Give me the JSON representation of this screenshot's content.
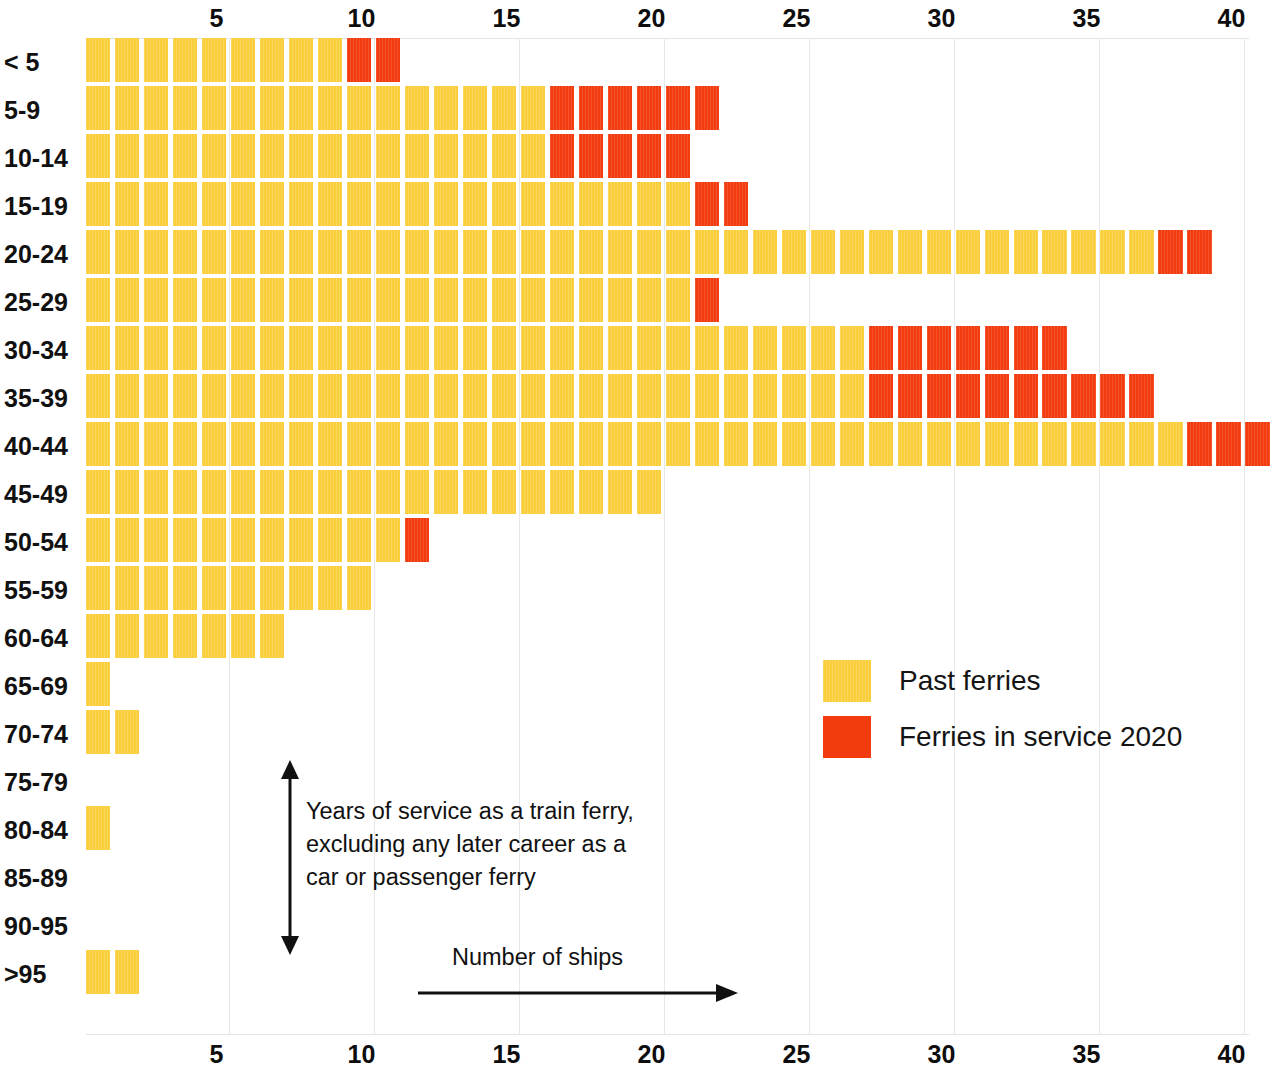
{
  "chart_data": {
    "type": "bar",
    "subtype": "unit-pictogram-horizontal-stacked",
    "title": "",
    "xlabel": "Number of ships",
    "ylabel": "Years of service as a train ferry, excluding any later career as a car or passenger ferry",
    "xlim": [
      0,
      41
    ],
    "ylim": null,
    "grid": true,
    "legend_position": "inside-right",
    "colors": {
      "past": "#F9CE3A",
      "service": "#F23B0E"
    },
    "x_ticks": [
      5,
      10,
      15,
      20,
      25,
      30,
      35,
      40
    ],
    "x_ticks_top": [
      5,
      10,
      15,
      20,
      25,
      30,
      35,
      40
    ],
    "categories": [
      "< 5",
      "5-9",
      "10-14",
      "15-19",
      "20-24",
      "25-29",
      "30-34",
      "35-39",
      "40-44",
      "45-49",
      "50-54",
      "55-59",
      "60-64",
      "65-69",
      "70-74",
      "75-79",
      "80-84",
      "85-89",
      "90-95",
      ">95"
    ],
    "series": [
      {
        "name": "Past ferries",
        "color": "#F9CE3A",
        "values": [
          9,
          16,
          16,
          21,
          37,
          21,
          27,
          27,
          38,
          20,
          11,
          10,
          7,
          1,
          2,
          0,
          1,
          0,
          0,
          2
        ]
      },
      {
        "name": "Ferries in service 2020",
        "color": "#F23B0E",
        "values": [
          2,
          6,
          5,
          2,
          2,
          1,
          7,
          10,
          3,
          0,
          1,
          0,
          0,
          0,
          0,
          0,
          0,
          0,
          0,
          0
        ]
      }
    ],
    "totals": [
      11,
      22,
      21,
      23,
      39,
      22,
      34,
      37,
      41,
      20,
      12,
      10,
      7,
      1,
      2,
      0,
      1,
      0,
      0,
      2
    ],
    "annotations": [
      {
        "name": "y-axis-note",
        "lines": [
          "Years of service as a train ferry,",
          "excluding any later career as a",
          "car or passenger ferry"
        ],
        "arrow": "vertical-double"
      },
      {
        "name": "x-axis-note",
        "lines": [
          "Number of ships"
        ],
        "arrow": "horizontal-right"
      }
    ]
  },
  "legend": {
    "items": [
      {
        "label": "Past ferries",
        "swatch": "past"
      },
      {
        "label": "Ferries in service 2020",
        "swatch": "service"
      }
    ]
  },
  "axis_note_lines": {
    "l0": "Years of service as a train ferry,",
    "l1": "excluding any later career as a",
    "l2": "car or passenger ferry"
  },
  "x_axis_note": "Number of ships"
}
